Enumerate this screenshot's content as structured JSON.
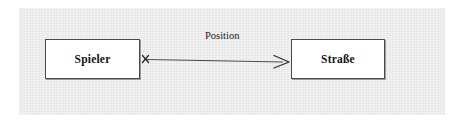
{
  "diagram": {
    "type": "uml-association-diagram",
    "canvas": {
      "background_color": "#ececec",
      "outer_background_color": "#ffffff"
    },
    "classes": [
      {
        "id": "spieler",
        "name": "Spieler",
        "fill_color": "#ffffff",
        "border_color": "#4a4a4a"
      },
      {
        "id": "strasse",
        "name": "Straße",
        "fill_color": "#ffffff",
        "border_color": "#4a4a4a"
      }
    ],
    "association": {
      "label": "Position",
      "source": "spieler",
      "target": "strasse",
      "source_marker": "x-cross",
      "target_marker": "open-arrowhead",
      "line_color": "#4a4a4a"
    }
  }
}
